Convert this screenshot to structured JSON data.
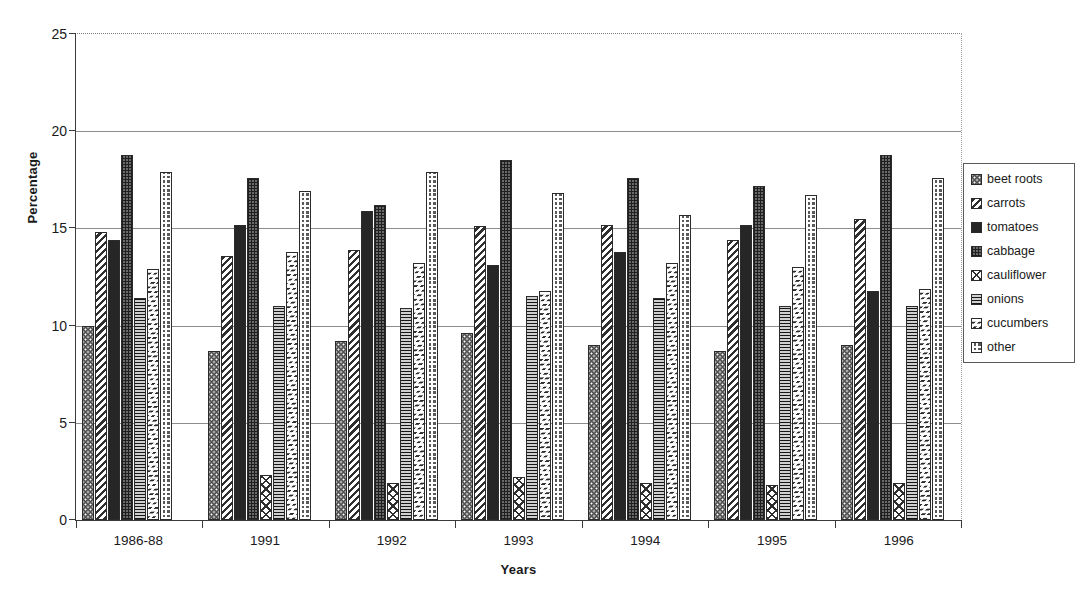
{
  "chart_data": {
    "type": "bar",
    "title": "",
    "xlabel": "Years",
    "ylabel": "Percentage",
    "ylim": [
      0,
      25
    ],
    "yticks": [
      0,
      5,
      10,
      15,
      20,
      25
    ],
    "grid": true,
    "legend_position": "right",
    "categories": [
      "1986-88",
      "1991",
      "1992",
      "1993",
      "1994",
      "1995",
      "1996"
    ],
    "series": [
      {
        "name": "beet roots",
        "pattern": "dark-dotted",
        "values": [
          10.0,
          8.7,
          9.2,
          9.6,
          9.0,
          8.7,
          9.0
        ]
      },
      {
        "name": "carrots",
        "pattern": "diagonal-stripes",
        "values": [
          14.8,
          13.6,
          13.9,
          15.1,
          15.2,
          14.4,
          15.5
        ]
      },
      {
        "name": "tomatoes",
        "pattern": "solid-dark",
        "values": [
          14.4,
          15.2,
          15.9,
          13.1,
          13.8,
          15.2,
          11.8
        ]
      },
      {
        "name": "cabbage",
        "pattern": "fine-grid",
        "values": [
          18.8,
          17.6,
          16.2,
          18.5,
          17.6,
          17.2,
          18.8
        ]
      },
      {
        "name": "cauliflower",
        "pattern": "cross-diamond",
        "values": [
          0,
          2.3,
          1.9,
          2.2,
          1.9,
          1.8,
          1.9
        ]
      },
      {
        "name": "onions",
        "pattern": "horizontal-lines",
        "values": [
          11.4,
          11.0,
          10.9,
          11.5,
          11.4,
          11.0,
          11.0
        ]
      },
      {
        "name": "cucumbers",
        "pattern": "chevron-wave",
        "values": [
          12.9,
          13.8,
          13.2,
          11.8,
          13.2,
          13.0,
          11.9
        ]
      },
      {
        "name": "other",
        "pattern": "checkerboard",
        "values": [
          17.9,
          16.9,
          17.9,
          16.8,
          15.7,
          16.7,
          17.6
        ]
      }
    ]
  },
  "axes": {
    "y_title": "Percentage",
    "x_title": "Years",
    "y_tick_labels": [
      "0",
      "5",
      "10",
      "15",
      "20",
      "25"
    ],
    "x_tick_labels": [
      "1986-88",
      "1991",
      "1992",
      "1993",
      "1994",
      "1995",
      "1996"
    ]
  },
  "legend": {
    "items": [
      {
        "label": "beet roots"
      },
      {
        "label": "carrots"
      },
      {
        "label": "tomatoes"
      },
      {
        "label": "cabbage"
      },
      {
        "label": "cauliflower"
      },
      {
        "label": "onions"
      },
      {
        "label": "cucumbers"
      },
      {
        "label": "other"
      }
    ]
  },
  "colors": {
    "axis": "#3a3a3a",
    "grid": "#8d8d8d",
    "ink": "#1a1a1a",
    "background": "#ffffff"
  }
}
